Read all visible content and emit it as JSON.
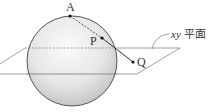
{
  "diagram": {
    "type": "3d-geometry-figure",
    "points": [
      {
        "id": "A",
        "label": "A",
        "x": 70,
        "y": 16
      },
      {
        "id": "P",
        "label": "P",
        "x": 102,
        "y": 38
      },
      {
        "id": "Q",
        "label": "Q",
        "x": 133,
        "y": 62
      }
    ],
    "plane_label": {
      "var": "xy",
      "text": "平面"
    },
    "colors": {
      "line": "#555555",
      "sphere_light": "#f4f4f4",
      "sphere_dark": "#bdbdbd",
      "plane": "#888888"
    }
  }
}
